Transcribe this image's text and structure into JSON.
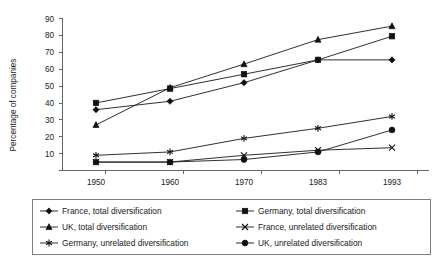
{
  "chart_data": {
    "type": "line",
    "title": "",
    "subtitle": "",
    "xlabel": "",
    "ylabel": "Percentage of companies",
    "categories": [
      "1950",
      "1960",
      "1970",
      "1983",
      "1993"
    ],
    "x_tick_labels": [
      "1950",
      "1960",
      "1970",
      "1983",
      "1993"
    ],
    "y_tick_labels": [
      "10",
      "20",
      "30",
      "40",
      "50",
      "60",
      "70",
      "80",
      "90"
    ],
    "ylim": [
      0,
      90
    ],
    "y_tick_step": 10,
    "grid": false,
    "legend_position": "bottom",
    "series": [
      {
        "name": "France, total diversification",
        "marker": "diamond",
        "values": [
          36,
          41,
          52,
          65.5,
          65.5
        ]
      },
      {
        "name": "Germany, total diversification",
        "marker": "square",
        "values": [
          40,
          48.5,
          57,
          65.5,
          79.5
        ]
      },
      {
        "name": "UK, total diversification",
        "marker": "triangle",
        "values": [
          27,
          49,
          63,
          77.5,
          85.5
        ]
      },
      {
        "name": "France, unrelated diversification",
        "marker": "x-cross",
        "values": [
          5,
          5,
          9,
          12,
          13.5
        ]
      },
      {
        "name": "Germany, unrelated diversification",
        "marker": "asterisk",
        "values": [
          9,
          11,
          19,
          25,
          32
        ]
      },
      {
        "name": "UK, unrelated diversification",
        "marker": "circle",
        "values": [
          5,
          5,
          6.5,
          11,
          24
        ]
      }
    ]
  },
  "legend": {
    "entries": [
      {
        "label": "France, total diversification",
        "marker": "diamond"
      },
      {
        "label": "Germany, total diversification",
        "marker": "square"
      },
      {
        "label": "UK, total diversification",
        "marker": "triangle"
      },
      {
        "label": "France, unrelated diversification",
        "marker": "x-cross"
      },
      {
        "label": "Germany, unrelated diversification",
        "marker": "asterisk"
      },
      {
        "label": "UK, unrelated diversification",
        "marker": "circle"
      }
    ]
  },
  "colors": {
    "series": "#111111",
    "axis": "#666666",
    "legend_border": "#808080",
    "background": "#ffffff"
  }
}
